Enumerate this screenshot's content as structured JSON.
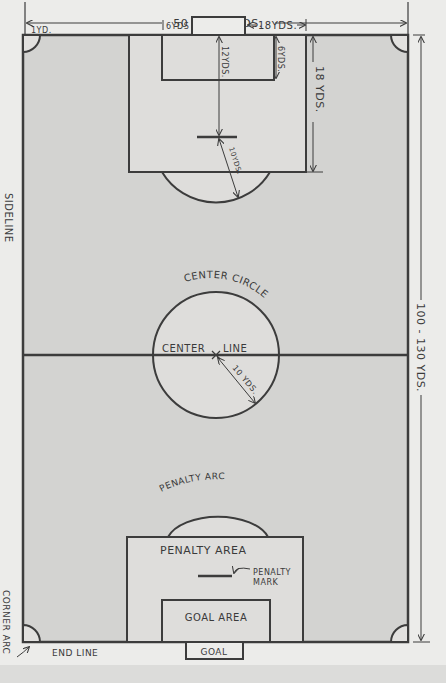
{
  "diagram": {
    "colors": {
      "paper": "#ececea",
      "field": "#d3d3d1",
      "area_fill": "#dedddb",
      "line": "#3c3c3c"
    },
    "dimensions": {
      "width_label": "50 TO 100YDS.",
      "length_label": "100 - 130 YDS.",
      "corner_radius_label": "1YD.",
      "goal_area_width_label": "6YDS",
      "penalty_area_offset_label": "18YDS.",
      "penalty_mark_distance_label": "12YDS.",
      "goal_area_depth_label": "6YDS.",
      "penalty_area_depth_label": "18 YDS.",
      "penalty_arc_radius_label": "10YDS.",
      "center_circle_radius_label": "10 YDS."
    },
    "labels": {
      "sideline": "SIDELINE",
      "center_circle": "CENTER CIRCLE",
      "center_line_left": "CENTER",
      "center_line_right": "LINE",
      "penalty_arc": "PENALTY ARC",
      "penalty_area": "PENALTY AREA",
      "penalty_mark_line1": "PENALTY",
      "penalty_mark_line2": "MARK",
      "goal_area": "GOAL AREA",
      "goal": "GOAL",
      "end_line": "END LINE",
      "corner_arc": "CORNER ARC"
    }
  }
}
